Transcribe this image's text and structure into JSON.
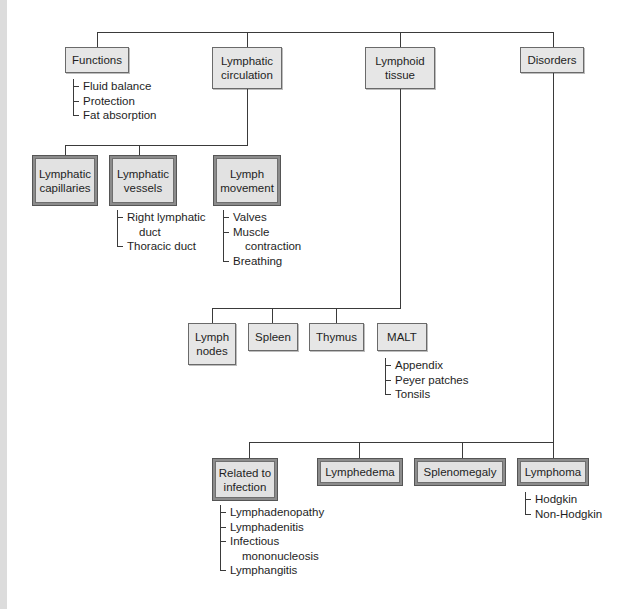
{
  "diagram": {
    "top_nodes": {
      "functions": {
        "label": "Functions",
        "children": [
          "Fluid balance",
          "Protection",
          "Fat absorption"
        ]
      },
      "circulation": {
        "label_line1": "Lymphatic",
        "label_line2": "circulation",
        "children": {
          "capillaries": {
            "label_line1": "Lymphatic",
            "label_line2": "capillaries"
          },
          "vessels": {
            "label_line1": "Lymphatic",
            "label_line2": "vessels",
            "items": [
              "Right lymphatic",
              "duct",
              "Thoracic duct"
            ]
          },
          "movement": {
            "label_line1": "Lymph",
            "label_line2": "movement",
            "items": [
              "Valves",
              "Muscle",
              "contraction",
              "Breathing"
            ]
          }
        }
      },
      "lymphoid": {
        "label_line1": "Lymphoid",
        "label_line2": "tissue",
        "children": {
          "nodes": {
            "label_line1": "Lymph",
            "label_line2": "nodes"
          },
          "spleen": {
            "label": "Spleen"
          },
          "thymus": {
            "label": "Thymus"
          },
          "malt": {
            "label": "MALT",
            "items": [
              "Appendix",
              "Peyer patches",
              "Tonsils"
            ]
          }
        }
      },
      "disorders": {
        "label": "Disorders",
        "children": {
          "infection": {
            "label_line1": "Related to",
            "label_line2": "infection",
            "items": [
              "Lymphadenopathy",
              "Lymphadenitis",
              "Infectious",
              "mononucleosis",
              "Lymphangitis"
            ]
          },
          "lymphedema": {
            "label": "Lymphedema"
          },
          "splenomegaly": {
            "label": "Splenomegaly"
          },
          "lymphoma": {
            "label": "Lymphoma",
            "items": [
              "Hodgkin",
              "Non-Hodgkin"
            ]
          }
        }
      }
    },
    "colors": {
      "box_fill": "#e6e6e6",
      "thick_border": "#8c8c8c",
      "line": "#3a3a3a",
      "edge_strip": "#dcdcdc"
    }
  }
}
